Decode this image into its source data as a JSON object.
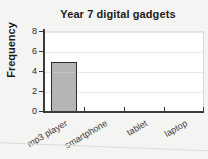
{
  "chart_data": {
    "type": "bar",
    "title": "Year 7 digital gadgets",
    "xlabel": "",
    "ylabel": "Frequency",
    "categories": [
      "mp3 player",
      "smartphone",
      "tablet",
      "laptop"
    ],
    "values": [
      5,
      0,
      0,
      0
    ],
    "ylim": [
      0,
      8
    ],
    "ytick_labels": [
      "0",
      "2",
      "4",
      "6",
      "8"
    ],
    "ytick_values": [
      0,
      2,
      4,
      6,
      8
    ],
    "grid": true,
    "legend": false,
    "bar_color": "#b5b5b5",
    "bar_edge_color": "#2e2e2e",
    "plot_background": "#ffffff",
    "page_background": "#f4f4f2",
    "text_color": "#1b1b1b"
  }
}
